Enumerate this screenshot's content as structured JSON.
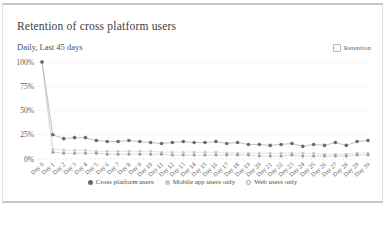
{
  "header": {
    "title": "Retention of cross platform users",
    "subtitle": "Daily, Last 45 days",
    "legend_label": "Retention"
  },
  "chart_data": {
    "type": "line",
    "title": "Retention of cross platform users",
    "subtitle": "Daily, Last 45 days",
    "xlabel": "",
    "ylabel": "",
    "ylim": [
      0,
      100
    ],
    "grid": "horizontal-dashed",
    "legend_position": "bottom",
    "y_ticks": [
      0,
      25,
      50,
      75,
      100
    ],
    "y_tick_labels": [
      "0%",
      "25%",
      "50%",
      "75%",
      "100%"
    ],
    "x": [
      "Day 0",
      "Day 1",
      "Day 2",
      "Day 3",
      "Day 4",
      "Day 5",
      "Day 6",
      "Day 7",
      "Day 8",
      "Day 9",
      "Day 10",
      "Day 11",
      "Day 12",
      "Day 13",
      "Day 14",
      "Day 15",
      "Day 16",
      "Day 17",
      "Day 18",
      "Day 19",
      "Day 20",
      "Day 21",
      "Day 22",
      "Day 23",
      "Day 24",
      "Day 25",
      "Day 26",
      "Day 27",
      "Day 28",
      "Day 29",
      "Day 30"
    ],
    "series": [
      {
        "name": "Cross platform users",
        "marker_style": "filled",
        "dot_color": "#6a6a6a",
        "line_color": "#b3b3b3",
        "values": [
          100,
          25,
          21,
          22,
          22,
          19,
          18,
          18,
          19,
          18,
          17,
          16,
          17,
          18,
          17,
          17,
          18,
          16,
          17,
          15,
          15,
          14,
          15,
          16,
          13,
          15,
          14,
          17,
          14,
          18,
          19
        ]
      },
      {
        "name": "Mobile app users only",
        "marker_style": "filled",
        "dot_color": "#c8c8c8",
        "line_color": "#e0e0e0",
        "values": [
          100,
          10,
          9,
          9,
          9,
          8,
          8,
          8,
          8,
          8,
          8,
          7,
          7,
          7,
          7,
          7,
          7,
          6,
          6,
          6,
          6,
          6,
          6,
          6,
          6,
          6,
          5,
          5,
          5,
          6,
          6
        ]
      },
      {
        "name": "Web users only",
        "marker_style": "ring",
        "dot_color": "#9c9c9c",
        "line_color": "#d2d2d2",
        "values": [
          100,
          7,
          6,
          6,
          6,
          6,
          5,
          5,
          5,
          5,
          5,
          5,
          4,
          4,
          4,
          4,
          4,
          4,
          4,
          4,
          3,
          3,
          3,
          4,
          3,
          3,
          3,
          3,
          3,
          4,
          4
        ]
      }
    ]
  },
  "colors": {
    "card_border": "#c6c6c6",
    "grid_line": "#e7e7e7",
    "axis_text": "#5a5a5a",
    "title_text": "#3d3d3d"
  }
}
